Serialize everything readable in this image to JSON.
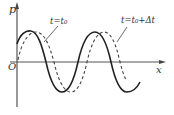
{
  "diagram": {
    "type": "wave-graph",
    "axes": {
      "y_label": "p",
      "x_label": "x",
      "origin_label": "O"
    },
    "curves": [
      {
        "name": "wave at t=t0",
        "style": "solid",
        "label": "t=t₀"
      },
      {
        "name": "wave at t=t0+Δt",
        "style": "dashed",
        "label": "t=t₀+Δt"
      }
    ],
    "labels": {
      "t0": "t=t₀",
      "t0_dt": "t=t₀+Δt"
    },
    "colors": {
      "line": "#222222",
      "axis": "#444444"
    }
  }
}
